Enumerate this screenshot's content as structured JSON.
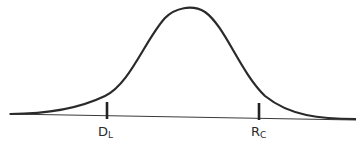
{
  "diagram": {
    "type": "normal-distribution-curve",
    "stroke_color": "#2a2a2a",
    "markers": [
      {
        "main": "D",
        "sub": "L",
        "x": 107
      },
      {
        "main": "R",
        "sub": "C",
        "x": 259
      }
    ]
  }
}
